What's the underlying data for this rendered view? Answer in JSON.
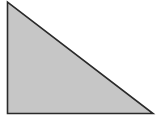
{
  "diagram": {
    "type": "right-triangle",
    "fill_color": "#c6c6c6",
    "stroke_color": "#2a2a2a",
    "background": "#ffffff",
    "vertices": {
      "top": [
        7.5,
        2
      ],
      "bottom_left": [
        7.5,
        113.5
      ],
      "bottom_right": [
        153,
        113.5
      ]
    }
  }
}
